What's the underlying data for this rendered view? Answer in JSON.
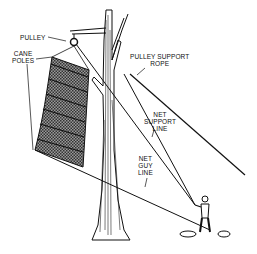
{
  "labels": {
    "pulley": "PULLEY",
    "cane_poles_1": "CANE",
    "cane_poles_2": "POLES",
    "pulley_support_rope_1": "PULLEY SUPPORT",
    "pulley_support_rope_2": "ROPE",
    "net_support_line_1": "NET",
    "net_support_line_2": "SUPPORT",
    "net_support_line_3": "LINE",
    "net_guy_line_1": "NET",
    "net_guy_line_2": "GUY",
    "net_guy_line_3": "LINE"
  },
  "colors": {
    "ink": "#111111",
    "net_fill": "#6e6e6e",
    "background": "#ffffff"
  }
}
